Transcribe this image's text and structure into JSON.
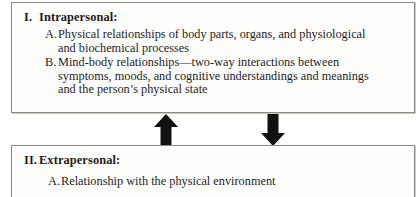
{
  "figure": {
    "colors": {
      "arrow": "#111111",
      "border": "#8a8a86",
      "text": "#1f1e1c",
      "background": "#ffffff"
    }
  },
  "panels": [
    {
      "id": "intrapersonal",
      "numeral": "I.",
      "heading": "Intrapersonal:",
      "items": [
        {
          "letter": "A.",
          "lines": [
            "Physical relationships of body parts, organs, and physiological",
            "and biochemical processes"
          ]
        },
        {
          "letter": "B.",
          "lines": [
            "Mind-body relationships—two-way interactions between",
            "symptoms, moods, and cognitive understandings and meanings",
            "and the person’s physical state"
          ]
        }
      ]
    },
    {
      "id": "extrapersonal",
      "numeral": "II.",
      "heading": "Extrapersonal:",
      "items": [
        {
          "letter": "A.",
          "lines": [
            "Relationship with the physical environment"
          ]
        }
      ]
    }
  ],
  "arrows": [
    {
      "id": "arrow-up",
      "direction": "up",
      "label": "upward-influence-arrow"
    },
    {
      "id": "arrow-down",
      "direction": "down",
      "label": "downward-influence-arrow"
    }
  ]
}
